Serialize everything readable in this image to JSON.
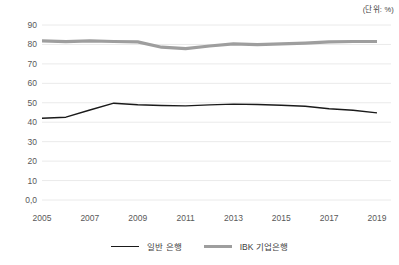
{
  "chart_data": {
    "type": "line",
    "unit_label": "(단위: %)",
    "title": "",
    "xlabel": "",
    "ylabel": "",
    "ylim": [
      0,
      90
    ],
    "grid": true,
    "legend_position": "bottom",
    "x": [
      2005,
      2006,
      2007,
      2008,
      2009,
      2010,
      2011,
      2012,
      2013,
      2014,
      2015,
      2016,
      2017,
      2018,
      2019
    ],
    "x_tick_labels": [
      "2005",
      "2007",
      "2009",
      "2011",
      "2013",
      "2015",
      "2017",
      "2019"
    ],
    "y_ticks": [
      {
        "value": 0,
        "label": "0,0"
      },
      {
        "value": 10,
        "label": "10"
      },
      {
        "value": 20,
        "label": "20"
      },
      {
        "value": 30,
        "label": "30"
      },
      {
        "value": 40,
        "label": "40"
      },
      {
        "value": 50,
        "label": "50"
      },
      {
        "value": 60,
        "label": "60"
      },
      {
        "value": 70,
        "label": "70"
      },
      {
        "value": 80,
        "label": "80"
      },
      {
        "value": 90,
        "label": "90"
      }
    ],
    "series": [
      {
        "name": "일반 은행",
        "color": "#1a1a1a",
        "stroke_width": 1.4,
        "values": [
          42.0,
          42.6,
          46.3,
          49.8,
          49.0,
          48.6,
          48.4,
          48.9,
          49.3,
          49.1,
          48.7,
          48.2,
          46.9,
          46.2,
          44.8
        ]
      },
      {
        "name": "IBK 기업은행",
        "color": "#9e9e9e",
        "stroke_width": 3.2,
        "values": [
          81.8,
          81.4,
          81.8,
          81.5,
          81.3,
          78.6,
          77.8,
          79.2,
          80.3,
          79.9,
          80.3,
          80.7,
          81.3,
          81.5,
          81.5
        ]
      }
    ],
    "colors": {
      "grid": "#eaeaea",
      "axis_text": "#595959",
      "background": "#ffffff"
    }
  }
}
